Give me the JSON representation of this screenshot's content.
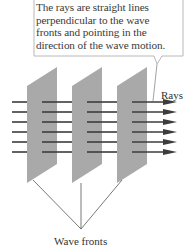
{
  "callout": {
    "lines": [
      "The rays are straight lines",
      "perpendicular to the wave",
      "fronts and pointing in the",
      "direction of the wave motion."
    ]
  },
  "labels": {
    "rays": "Rays",
    "wave_fronts": "Wave fronts"
  },
  "colors": {
    "plane_fill": "#a9a9a9",
    "ray": "#3c3c3c",
    "callout_border": "#b8b8b8",
    "text": "#333333"
  },
  "diagram": {
    "wave_front_count": 3,
    "ray_count": 6
  }
}
